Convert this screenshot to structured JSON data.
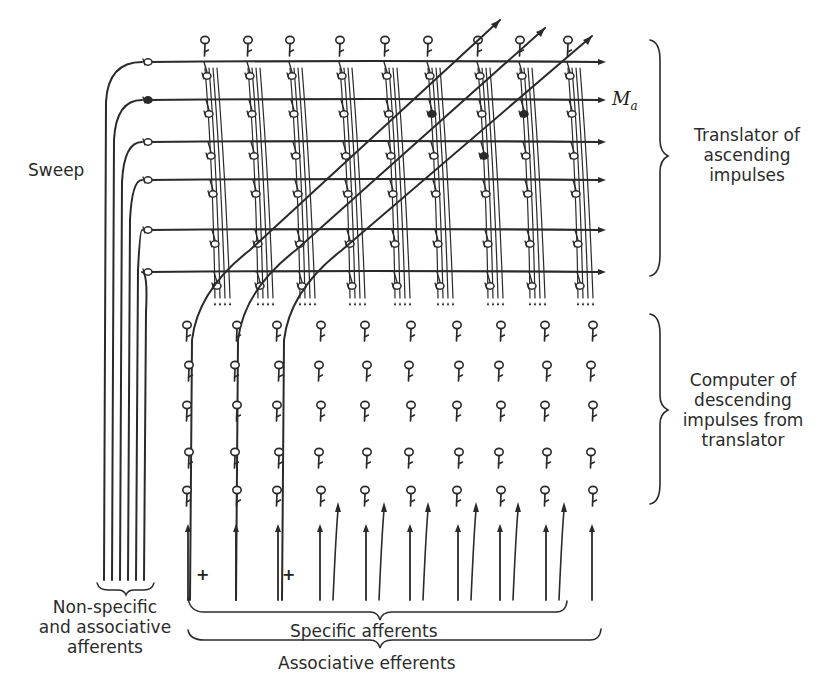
{
  "labels": {
    "sweep": "Sweep",
    "translator": [
      "Translator of",
      "ascending",
      "impulses"
    ],
    "computer": [
      "Computer of",
      "descending",
      "impulses from",
      "translator"
    ],
    "non_specific": [
      "Non-specific",
      "and associative",
      "afferents"
    ],
    "specific_afferents": "Specific afferents",
    "associative_efferents": "Associative efferents",
    "output_label_main": "M",
    "output_label_sub": "a",
    "plus_sign": "+"
  },
  "colors": {
    "ink": "#2a2a2a",
    "background": "#ffffff"
  },
  "geometry": {
    "translator_rows_y": [
      62,
      100,
      142,
      180,
      230,
      272
    ],
    "sweep_cell_x": 148,
    "sweep_filled_row": 1,
    "translator_columns_x": [
      205,
      248,
      290,
      340,
      385,
      428,
      478,
      520,
      568
    ],
    "top_cells_y": 40,
    "computer_columns_x": [
      188,
      236,
      278,
      320,
      366,
      410,
      458,
      500,
      546,
      592
    ],
    "computer_rows_y": [
      325,
      365,
      405,
      452,
      490
    ],
    "arrow_row_y": 532,
    "bottom_y": 600,
    "diagonal_fibers": 3,
    "plus_positions": [
      [
        196,
        566
      ],
      [
        282,
        566
      ]
    ]
  }
}
